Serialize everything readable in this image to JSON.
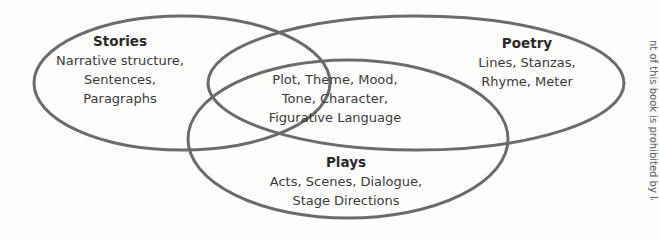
{
  "diagram": {
    "type": "venn",
    "stroke_color": "#6b6b6b",
    "sets": [
      {
        "id": "stories",
        "title": "Stories",
        "items": [
          "Narrative structure,",
          "Sentences,",
          "Paragraphs"
        ]
      },
      {
        "id": "poetry",
        "title": "Poetry",
        "items": [
          "Lines, Stanzas,",
          "Rhyme, Meter"
        ]
      },
      {
        "id": "plays",
        "title": "Plays",
        "items": [
          "Acts, Scenes, Dialogue,",
          "Stage Directions"
        ]
      }
    ],
    "intersection": {
      "items": [
        "Plot, Theme, Mood,",
        "Tone, Character,",
        "Figurative Language"
      ]
    }
  },
  "side_note": "nt of this book is prohibited by law"
}
